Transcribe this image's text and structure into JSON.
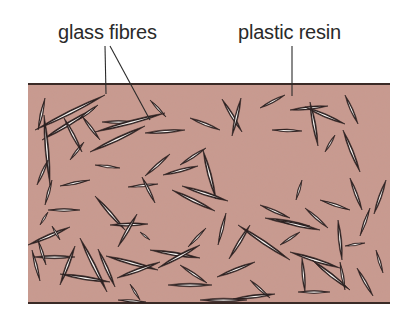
{
  "labels": {
    "glass_fibres": "glass fibres",
    "plastic_resin": "plastic resin"
  },
  "colors": {
    "resin_fill": "#c99a8f",
    "border_line": "#3a2a26",
    "fibre_dark": "#2b2020",
    "fibre_light": "#f4f1ee",
    "leader_line": "#2a2a2a"
  },
  "composite_block": {
    "x": 28,
    "y": 84,
    "width": 362,
    "height": 219
  },
  "leaders": [
    {
      "name": "glass-fibres-leader-vertical",
      "x1": 105,
      "y1": 46,
      "x2": 106,
      "y2": 94
    },
    {
      "name": "glass-fibres-leader-diagonal",
      "x1": 110,
      "y1": 46,
      "x2": 150,
      "y2": 120
    },
    {
      "name": "plastic-resin-leader",
      "x1": 292,
      "y1": 46,
      "x2": 292,
      "y2": 96
    }
  ],
  "fibres": [
    [
      38,
      130,
      45,
      98
    ],
    [
      35,
      130,
      105,
      95
    ],
    [
      42,
      140,
      95,
      108
    ],
    [
      70,
      160,
      84,
      142
    ],
    [
      44,
      115,
      50,
      185
    ],
    [
      48,
      160,
      37,
      185
    ],
    [
      45,
      205,
      52,
      180
    ],
    [
      78,
      120,
      98,
      105
    ],
    [
      64,
      118,
      82,
      152
    ],
    [
      82,
      116,
      100,
      140
    ],
    [
      102,
      122,
      135,
      122
    ],
    [
      95,
      132,
      165,
      113
    ],
    [
      90,
      152,
      145,
      126
    ],
    [
      145,
      133,
      185,
      130
    ],
    [
      150,
      100,
      166,
      117
    ],
    [
      190,
      118,
      220,
      130
    ],
    [
      222,
      99,
      242,
      132
    ],
    [
      260,
      108,
      285,
      95
    ],
    [
      272,
      130,
      302,
      131
    ],
    [
      241,
      98,
      232,
      136
    ],
    [
      290,
      110,
      328,
      106
    ],
    [
      305,
      107,
      345,
      124
    ],
    [
      310,
      102,
      318,
      146
    ],
    [
      345,
      95,
      358,
      124
    ],
    [
      343,
      130,
      360,
      172
    ],
    [
      325,
      152,
      335,
      135
    ],
    [
      95,
      165,
      120,
      168
    ],
    [
      60,
      186,
      90,
      180
    ],
    [
      128,
      187,
      158,
      184
    ],
    [
      142,
      177,
      155,
      203
    ],
    [
      145,
      176,
      170,
      154
    ],
    [
      163,
      175,
      198,
      166
    ],
    [
      180,
      165,
      206,
      148
    ],
    [
      203,
      150,
      216,
      199
    ],
    [
      182,
      186,
      228,
      201
    ],
    [
      172,
      190,
      215,
      211
    ],
    [
      40,
      225,
      48,
      212
    ],
    [
      48,
      210,
      80,
      210
    ],
    [
      28,
      245,
      70,
      227
    ],
    [
      52,
      226,
      60,
      240
    ],
    [
      95,
      196,
      125,
      230
    ],
    [
      110,
      225,
      148,
      224
    ],
    [
      137,
      214,
      118,
      247
    ],
    [
      140,
      232,
      150,
      240
    ],
    [
      150,
      250,
      200,
      258
    ],
    [
      188,
      247,
      206,
      228
    ],
    [
      218,
      245,
      226,
      213
    ],
    [
      238,
      225,
      290,
      260
    ],
    [
      260,
      205,
      290,
      218
    ],
    [
      265,
      218,
      310,
      226
    ],
    [
      280,
      245,
      300,
      232
    ],
    [
      296,
      200,
      302,
      180
    ],
    [
      305,
      208,
      328,
      228
    ],
    [
      320,
      200,
      350,
      210
    ],
    [
      350,
      178,
      362,
      210
    ],
    [
      338,
      220,
      342,
      260
    ],
    [
      345,
      246,
      365,
      243
    ],
    [
      360,
      236,
      370,
      208
    ],
    [
      374,
      214,
      386,
      180
    ],
    [
      32,
      250,
      40,
      281
    ],
    [
      34,
      257,
      75,
      257
    ],
    [
      75,
      246,
      60,
      285
    ],
    [
      80,
      238,
      107,
      292
    ],
    [
      98,
      249,
      115,
      287
    ],
    [
      106,
      256,
      158,
      270
    ],
    [
      117,
      278,
      160,
      262
    ],
    [
      158,
      268,
      200,
      245
    ],
    [
      180,
      265,
      207,
      283
    ],
    [
      217,
      277,
      255,
      262
    ],
    [
      229,
      259,
      250,
      225
    ],
    [
      276,
      220,
      320,
      230
    ],
    [
      290,
      252,
      340,
      268
    ],
    [
      302,
      258,
      305,
      292
    ],
    [
      312,
      260,
      350,
      290
    ],
    [
      298,
      292,
      330,
      292
    ],
    [
      340,
      262,
      345,
      290
    ],
    [
      233,
      299,
      275,
      294
    ],
    [
      200,
      300,
      247,
      300
    ],
    [
      60,
      274,
      110,
      282
    ],
    [
      38,
      240,
      46,
      265
    ],
    [
      130,
      284,
      140,
      300
    ],
    [
      168,
      285,
      212,
      285
    ],
    [
      250,
      280,
      270,
      298
    ],
    [
      357,
      268,
      373,
      296
    ],
    [
      118,
      300,
      146,
      302
    ],
    [
      376,
      250,
      383,
      273
    ]
  ]
}
